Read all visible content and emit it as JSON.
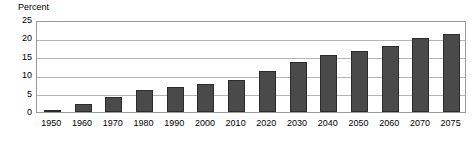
{
  "chart_data": {
    "type": "bar",
    "title": "",
    "ylabel": "Percent",
    "xlabel": "",
    "categories": [
      "1950",
      "1960",
      "1970",
      "1980",
      "1990",
      "2000",
      "2010",
      "2020",
      "2030",
      "2040",
      "2050",
      "2060",
      "2070",
      "2075"
    ],
    "values": [
      0.3,
      2.2,
      4.0,
      6.0,
      6.8,
      7.6,
      8.8,
      11.2,
      13.5,
      15.4,
      16.6,
      17.9,
      20.2,
      21.2
    ],
    "ylim": [
      0,
      25
    ],
    "yticks": [
      0,
      5,
      10,
      15,
      20,
      25
    ],
    "ytick_labels": [
      "0",
      "5",
      "10",
      "15",
      "20",
      "25"
    ],
    "grid": true,
    "grid_axis": "y",
    "legend": false,
    "legend_position": "none",
    "bar_color": "#4a4a4a",
    "bar_edge_color": "#2b2b2b",
    "gridline_color": "#b4b4b4",
    "plot_border_color": "#9a9a9a",
    "background_color": "#ffffff"
  }
}
